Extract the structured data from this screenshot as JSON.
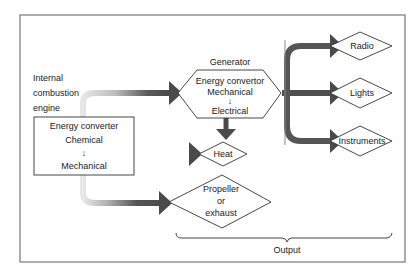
{
  "diagram": {
    "engine": {
      "caption_lines": [
        "Internal",
        "combustion",
        "engine"
      ],
      "box_lines": [
        "Energy converter",
        "Chemical",
        "↓",
        "Mechanical"
      ]
    },
    "generator": {
      "caption": "Generator",
      "box_lines": [
        "Energy convertor",
        "Mechanical",
        "↓",
        "Electrical"
      ]
    },
    "outputs": {
      "radio": "Radio",
      "lights": "Lights",
      "instruments": "Instruments",
      "heat": "Heat",
      "propeller_lines": [
        "Propeller",
        "or",
        "exhaust"
      ]
    },
    "brace_label": "Output",
    "colors": {
      "arrow_dark": "#4a4a4a",
      "arrow_light": "#d8d8d8",
      "frame": "#777777",
      "outline": "#333333"
    }
  }
}
